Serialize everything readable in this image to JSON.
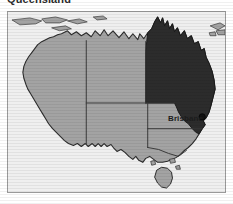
{
  "page": {
    "title": "Queensland",
    "background_color": "#ffffff"
  },
  "map": {
    "name": "map-of-australia",
    "frame_border_color": "#9a9a9a",
    "ocean_color": "#efefef",
    "land_color": "#a3a3a3",
    "highlight_color": "#2c2c2c",
    "border_line_color": "#3a3a3a",
    "highlighted_state": "Queensland",
    "city_label": "Brisbane",
    "states": [
      {
        "code": "WA",
        "name": "Western Australia",
        "highlighted": false
      },
      {
        "code": "NT",
        "name": "Northern Territory",
        "highlighted": false
      },
      {
        "code": "SA",
        "name": "South Australia",
        "highlighted": false
      },
      {
        "code": "QLD",
        "name": "Queensland",
        "highlighted": true
      },
      {
        "code": "NSW",
        "name": "New South Wales",
        "highlighted": false
      },
      {
        "code": "VIC",
        "name": "Victoria",
        "highlighted": false
      },
      {
        "code": "TAS",
        "name": "Tasmania",
        "highlighted": false
      }
    ],
    "cities": [
      {
        "name": "Brisbane",
        "x": 196,
        "y": 106
      }
    ]
  }
}
